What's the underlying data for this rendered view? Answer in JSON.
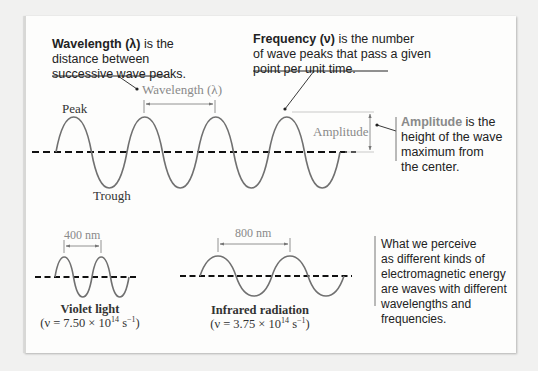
{
  "figure": {
    "wavelength_callout": {
      "term": "Wavelength (λ)",
      "rest_line1": " is the",
      "line2": "distance between",
      "line3": "successive wave peaks."
    },
    "frequency_callout": {
      "term": "Frequency (ν)",
      "rest_line1": " is the number",
      "line2": "of wave peaks that pass a given",
      "line3": "point per unit time."
    },
    "amplitude_callout": {
      "term": "Amplitude",
      "rest_line1": " is the",
      "line2": "height of the wave",
      "line3": "maximum from",
      "line4": "the center."
    },
    "energy_note": {
      "lines": [
        "What we perceive",
        "as different kinds of",
        "electromagnetic energy",
        "are waves with different",
        "wavelengths and",
        "frequencies."
      ]
    },
    "labels": {
      "peak": "Peak",
      "trough": "Trough",
      "wavelength_dim": "Wavelength (λ)",
      "amplitude_dim": "Amplitude"
    },
    "violet": {
      "dim": "400 nm",
      "name": "Violet light",
      "freq_prefix": "(ν = 7.50 × 10",
      "freq_exp": "14",
      "freq_unit": " s",
      "freq_unit_exp": "−1",
      "freq_suffix": ")"
    },
    "infrared": {
      "dim": "800 nm",
      "name": "Infrared radiation",
      "freq_prefix": "(ν = 3.75 × 10",
      "freq_exp": "14",
      "freq_unit": " s",
      "freq_unit_exp": "−1",
      "freq_suffix": ")"
    },
    "colors": {
      "accent_text": "#8a8a8a",
      "wave": "#6f6f6f",
      "text": "#222222"
    }
  }
}
